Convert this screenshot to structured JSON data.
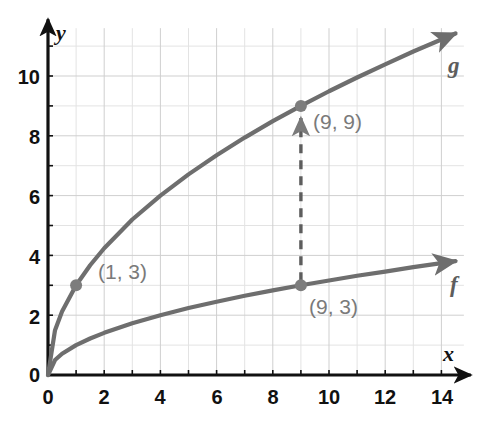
{
  "chart_data": {
    "type": "line",
    "title": "",
    "xlabel": "x",
    "ylabel": "y",
    "xlim": [
      0,
      14.8
    ],
    "ylim": [
      0,
      11.6
    ],
    "grid": true,
    "legend_position": "inline-curve-end",
    "x_ticks": [
      "0",
      "2",
      "4",
      "6",
      "8",
      "10",
      "12",
      "14"
    ],
    "x_tick_values": [
      0,
      2,
      4,
      6,
      8,
      10,
      12,
      14
    ],
    "y_ticks": [
      "0",
      "2",
      "4",
      "6",
      "8",
      "10"
    ],
    "y_tick_values": [
      0,
      2,
      4,
      6,
      8,
      10
    ],
    "minor_grid_step": 1,
    "major_grid_step": 2,
    "series": [
      {
        "name": "g",
        "label": "g",
        "formula": "y = 3*sqrt(x)",
        "color": "#6e6e6e",
        "x": [
          0,
          0.25,
          0.5,
          1,
          1.5,
          2,
          3,
          4,
          5,
          6,
          7,
          8,
          9,
          10,
          11,
          12,
          13,
          14,
          14.5
        ],
        "values": [
          0,
          1.5,
          2.12,
          3,
          3.67,
          4.24,
          5.2,
          6,
          6.71,
          7.35,
          7.94,
          8.49,
          9,
          9.49,
          9.95,
          10.39,
          10.82,
          11.22,
          11.42
        ]
      },
      {
        "name": "f",
        "label": "f",
        "formula": "y = sqrt(x)",
        "color": "#6e6e6e",
        "x": [
          0,
          0.25,
          0.5,
          1,
          1.5,
          2,
          3,
          4,
          5,
          6,
          7,
          8,
          9,
          10,
          11,
          12,
          13,
          14,
          14.5
        ],
        "values": [
          0,
          0.5,
          0.71,
          1,
          1.22,
          1.41,
          1.73,
          2,
          2.24,
          2.45,
          2.65,
          2.83,
          3,
          3.16,
          3.32,
          3.46,
          3.61,
          3.74,
          3.81
        ]
      }
    ],
    "points": [
      {
        "id": "p1",
        "label": "(1, 3)",
        "x": 1,
        "y": 3,
        "series": "g"
      },
      {
        "id": "p2",
        "label": "(9, 9)",
        "x": 9,
        "y": 9,
        "series": "g"
      },
      {
        "id": "p3",
        "label": "(9, 3)",
        "x": 9,
        "y": 3,
        "series": "f"
      }
    ],
    "annotations": [
      {
        "id": "vertical-arrow",
        "type": "dashed-arrow",
        "from": {
          "x": 9,
          "y": 3
        },
        "to": {
          "x": 9,
          "y": 9
        },
        "color": "#5d5d5d"
      }
    ],
    "colors": {
      "curve": "#6e6e6e",
      "point": "#7d7d7d",
      "axis": "#111111",
      "grid_minor": "#e3e3e3",
      "grid_major": "#cfcfcf",
      "label_text": "#7a7a7a",
      "tick_text": "#111111",
      "background": "#ffffff"
    }
  },
  "axes": {
    "y_axis_label": "y",
    "x_axis_label": "x"
  },
  "curve_labels": {
    "g": "g",
    "f": "f"
  },
  "point_labels": {
    "p1": "(1, 3)",
    "p2": "(9, 9)",
    "p3": "(9, 3)"
  },
  "y_tick_labels": [
    "10",
    "8",
    "6",
    "4",
    "2",
    "0"
  ],
  "x_tick_labels": [
    "0",
    "2",
    "4",
    "6",
    "8",
    "10",
    "12",
    "14"
  ]
}
